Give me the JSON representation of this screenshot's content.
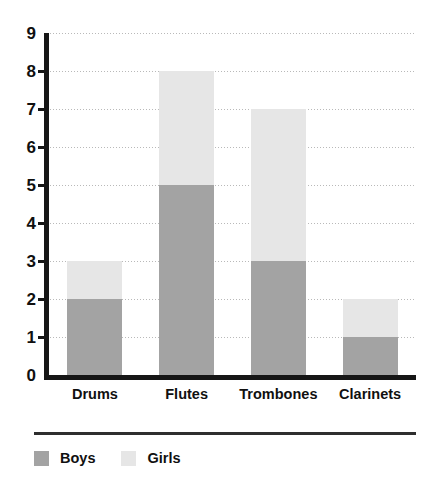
{
  "chart_data": {
    "type": "bar",
    "subtype": "stacked-bar",
    "title": "",
    "xlabel": "",
    "ylabel": "",
    "ylim": [
      0,
      9
    ],
    "y_ticks": [
      0,
      1,
      2,
      3,
      4,
      5,
      6,
      7,
      8,
      9
    ],
    "grid": true,
    "grid_style": "dotted-horizontal",
    "legend_position": "bottom-left",
    "categories": [
      "Drums",
      "Flutes",
      "Trombones",
      "Clarinets"
    ],
    "series": [
      {
        "name": "Boys",
        "color": "#a3a3a3",
        "values": [
          2,
          5,
          3,
          1
        ]
      },
      {
        "name": "Girls",
        "color": "#e6e6e6",
        "values": [
          1,
          3,
          4,
          1
        ]
      }
    ],
    "totals": [
      3,
      8,
      7,
      2
    ]
  },
  "axis": {
    "tick_labels": [
      "9",
      "8",
      "7",
      "6",
      "5",
      "4",
      "3",
      "2",
      "1",
      "0"
    ]
  },
  "categories": {
    "items": [
      {
        "label": "Drums"
      },
      {
        "label": "Flutes"
      },
      {
        "label": "Trombones"
      },
      {
        "label": "Clarinets"
      }
    ]
  },
  "legend": {
    "items": [
      {
        "label": "Boys",
        "color": "#a3a3a3"
      },
      {
        "label": "Girls",
        "color": "#e6e6e6"
      }
    ]
  },
  "colors": {
    "boys": "#a3a3a3",
    "girls": "#e6e6e6",
    "axis": "#161616",
    "grid": "#b9b9b9",
    "text": "#101010",
    "background": "#ffffff"
  }
}
